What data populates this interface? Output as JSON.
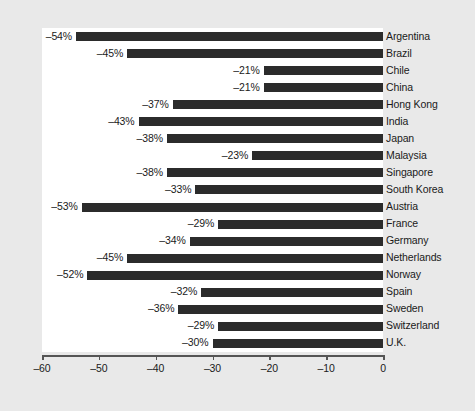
{
  "chart_data": {
    "type": "bar",
    "orientation": "horizontal",
    "title": "",
    "subtitle": "",
    "xlabel": "",
    "ylabel": "",
    "xlim": [
      -60,
      0
    ],
    "x_ticks": [
      -60,
      -50,
      -40,
      -30,
      -20,
      -10,
      0
    ],
    "x_tick_labels": [
      "–60",
      "–50",
      "–40",
      "–30",
      "–20",
      "–10",
      "0"
    ],
    "grid": false,
    "legend": null,
    "categories": [
      "Argentina",
      "Brazil",
      "Chile",
      "China",
      "Hong Kong",
      "India",
      "Japan",
      "Malaysia",
      "Singapore",
      "South Korea",
      "Austria",
      "France",
      "Germany",
      "Netherlands",
      "Norway",
      "Spain",
      "Sweden",
      "Switzerland",
      "U.K."
    ],
    "values": [
      -54,
      -45,
      -21,
      -21,
      -37,
      -43,
      -38,
      -23,
      -38,
      -33,
      -53,
      -29,
      -34,
      -45,
      -52,
      -32,
      -36,
      -29,
      -30
    ],
    "data_labels": [
      "–54%",
      "–45%",
      "–21%",
      "–21%",
      "–37%",
      "–43%",
      "–38%",
      "–23%",
      "–38%",
      "–33%",
      "–53%",
      "–29%",
      "–34%",
      "–45%",
      "–52%",
      "–32%",
      "–36%",
      "–29%",
      "–30%"
    ],
    "colors": {
      "bar": "#2b2b2b",
      "plot_background": "#ffffff",
      "figure_background": "#e9e9e9",
      "axis": "#555555",
      "text": "#1a1a1a"
    }
  }
}
